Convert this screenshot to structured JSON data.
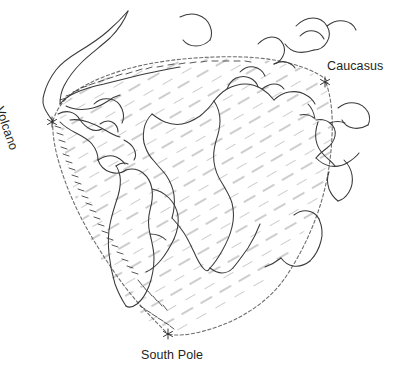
{
  "figure": {
    "kind": "hand-drawn-continental-reconstruction-map",
    "background_color": "#ffffff",
    "ink_color": "#231f20",
    "coastline_color": "#3a3a3c",
    "hatch_color": "#9b9b9e",
    "dashed_boundary_color": "#6e6e72"
  },
  "labels": {
    "caucasus": "Caucasus",
    "south_pole": "South Pole",
    "volcano": "Volcano"
  },
  "markers": [
    {
      "name": "volcano-marker",
      "glyph": "asterisk",
      "x": 52,
      "y": 122
    },
    {
      "name": "caucasus-marker",
      "glyph": "asterisk",
      "x": 325,
      "y": 82
    },
    {
      "name": "south-pole-marker",
      "glyph": "asterisk",
      "x": 168,
      "y": 334
    }
  ],
  "features": {
    "north_america": "north-america-coastline",
    "south_america": "south-america-coastline",
    "africa": "africa-coastline",
    "europe": "europe-coastline",
    "mediterranean": "mediterranean-coastline",
    "arabia": "arabian-peninsula-coastline",
    "greenland": "greenland-coastline",
    "madagascar": "madagascar-coastline"
  },
  "shaded_region": {
    "name": "hatched-gondwana-region",
    "hatch_angle_deg": -30,
    "hatch_spacing_px": 20
  }
}
